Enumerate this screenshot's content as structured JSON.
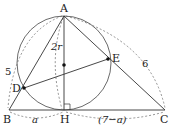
{
  "diagram": {
    "type": "geometry",
    "points": {
      "A": {
        "label": "A",
        "x": 64,
        "y": 16
      },
      "B": {
        "label": "B",
        "x": 9,
        "y": 110
      },
      "H": {
        "label": "H",
        "x": 64,
        "y": 110
      },
      "C": {
        "label": "C",
        "x": 165,
        "y": 110
      },
      "D": {
        "label": "D",
        "x": 24,
        "y": 88
      },
      "E": {
        "label": "E",
        "x": 108,
        "y": 59
      },
      "O": {
        "x": 64,
        "y": 65
      }
    },
    "measurements": {
      "AB": "5",
      "AC": "6",
      "AH": "2r",
      "BH": "a",
      "HC": "(7−a)"
    },
    "colors": {
      "stroke": "#333333",
      "dashed": "#555555",
      "background": "#ffffff"
    }
  }
}
